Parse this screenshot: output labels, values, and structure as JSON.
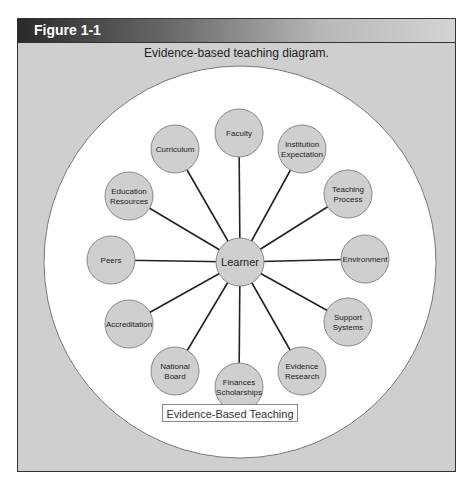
{
  "figure": {
    "label": "Figure 1-1",
    "caption": "Evidence-based teaching diagram.",
    "footer_label": "Evidence-Based Teaching"
  },
  "diagram": {
    "center": {
      "label": "Learner",
      "x": 240,
      "y": 262,
      "r": 24
    },
    "outer_circle": {
      "x": 240,
      "y": 262,
      "r": 196
    },
    "colors": {
      "node_fill": "#cfcfcf",
      "node_stroke": "#888888",
      "line": "#222222",
      "outer_fill": "#ffffff"
    },
    "nodes": [
      {
        "lines": [
          "Faculty"
        ],
        "x": 239,
        "y": 133
      },
      {
        "lines": [
          "Institution",
          "Expectation"
        ],
        "x": 302,
        "y": 149
      },
      {
        "lines": [
          "Teaching",
          "Process"
        ],
        "x": 348,
        "y": 194
      },
      {
        "lines": [
          "Environment"
        ],
        "x": 365,
        "y": 259
      },
      {
        "lines": [
          "Support",
          "Systems"
        ],
        "x": 348,
        "y": 322
      },
      {
        "lines": [
          "Evidence",
          "Research"
        ],
        "x": 302,
        "y": 371
      },
      {
        "lines": [
          "Finances",
          "Scholarships"
        ],
        "x": 239,
        "y": 387
      },
      {
        "lines": [
          "National",
          "Board"
        ],
        "x": 175,
        "y": 371
      },
      {
        "lines": [
          "Accreditation"
        ],
        "x": 129,
        "y": 324
      },
      {
        "lines": [
          "Peers"
        ],
        "x": 111,
        "y": 260
      },
      {
        "lines": [
          "Education",
          "Resources"
        ],
        "x": 129,
        "y": 196
      },
      {
        "lines": [
          "Curriculum"
        ],
        "x": 175,
        "y": 149
      }
    ]
  }
}
